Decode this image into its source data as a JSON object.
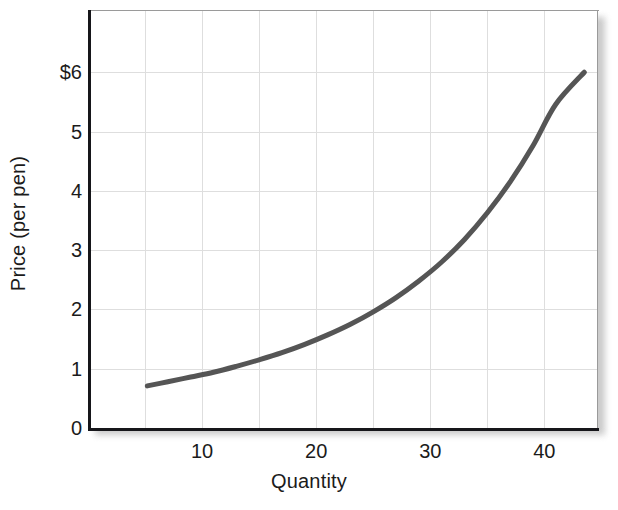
{
  "chart_data": {
    "type": "line",
    "title": "",
    "subtitle": "",
    "xlabel": "Quantity",
    "ylabel": "Price (per pen)",
    "xlim": [
      0,
      44.7
    ],
    "ylim": [
      0,
      7.05
    ],
    "grid": true,
    "legend": null,
    "series": [
      {
        "name": "Supply curve",
        "color": "#555555",
        "line_width": 5,
        "x": [
          5.2,
          7,
          9,
          11,
          13,
          15,
          17,
          19,
          21,
          23,
          25,
          27,
          29,
          31,
          33,
          35,
          37,
          39,
          41,
          43.5
        ],
        "y": [
          0.71,
          0.78,
          0.86,
          0.94,
          1.04,
          1.15,
          1.27,
          1.41,
          1.57,
          1.75,
          1.96,
          2.2,
          2.48,
          2.8,
          3.18,
          3.63,
          4.15,
          4.76,
          5.46,
          6.0
        ]
      }
    ],
    "y_ticks": [
      {
        "value": 6,
        "label": "$6"
      },
      {
        "value": 5,
        "label": "5"
      },
      {
        "value": 4,
        "label": "4"
      },
      {
        "value": 3,
        "label": "3"
      },
      {
        "value": 2,
        "label": "2"
      },
      {
        "value": 1,
        "label": "1"
      },
      {
        "value": 0,
        "label": "0"
      }
    ],
    "x_ticks": [
      {
        "value": 10,
        "label": "10"
      },
      {
        "value": 20,
        "label": "20"
      },
      {
        "value": 30,
        "label": "30"
      },
      {
        "value": 40,
        "label": "40"
      }
    ],
    "colors": {
      "curve": "#555555",
      "axis": "#16161a",
      "gridline": "#dedede",
      "frame": "#9a9a9a",
      "text": "#1b1b1b",
      "background": "#ffffff"
    }
  },
  "axis_titles": {
    "x": "Quantity",
    "y": "Price (per pen)"
  }
}
